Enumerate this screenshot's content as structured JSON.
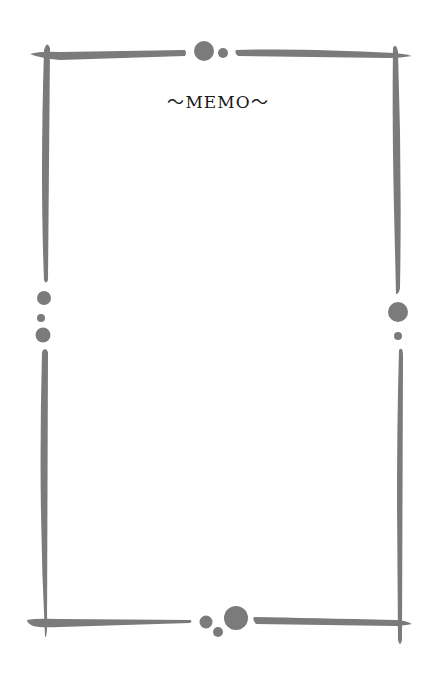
{
  "memo": {
    "title": "〜MEMO〜",
    "body": ""
  },
  "frame": {
    "color": "#7b7b7b",
    "background": "#ffffff"
  }
}
